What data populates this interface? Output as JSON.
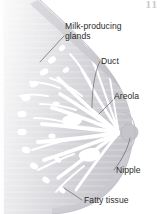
{
  "figure": {
    "background_color": "#ffffff",
    "tissue_color": "#d6d6da",
    "tissue_color_light": "#ececed",
    "outline_color": "#b9b9be",
    "duct_color": "#ffffff",
    "leader_color": "#6d6d72",
    "text_color": "#2b2b2b",
    "page_marker": "11"
  },
  "labels": {
    "glands": "Milk-producing\nglands",
    "glands_line1": "Milk-producing",
    "glands_line2": "glands",
    "duct": "Duct",
    "areola": "Areola",
    "nipple": "Nipple",
    "fatty_tissue": "Fatty tissue"
  },
  "structures": [
    {
      "name": "milk-producing-glands",
      "label": "Milk-producing glands"
    },
    {
      "name": "duct",
      "label": "Duct"
    },
    {
      "name": "areola",
      "label": "Areola"
    },
    {
      "name": "nipple",
      "label": "Nipple"
    },
    {
      "name": "fatty-tissue",
      "label": "Fatty tissue"
    }
  ]
}
